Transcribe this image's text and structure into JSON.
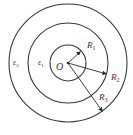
{
  "diagram": {
    "center": {
      "label": "O",
      "x": 68,
      "y": 63
    },
    "circles": [
      {
        "name": "inner",
        "radius": 18
      },
      {
        "name": "middle",
        "radius": 40
      },
      {
        "name": "outer",
        "radius": 59
      }
    ],
    "radii": [
      {
        "label": "R",
        "sub": "1",
        "tip": [
          81,
          51
        ],
        "label_pos": [
          87,
          48
        ]
      },
      {
        "label": "R",
        "sub": "2",
        "tip": [
          107,
          74
        ],
        "label_pos": [
          111,
          80
        ]
      },
      {
        "label": "R",
        "sub": "3",
        "tip": [
          103,
          112
        ],
        "label_pos": [
          99,
          100
        ]
      }
    ],
    "regions": [
      {
        "label": "ε",
        "sub": "1",
        "pos": [
          38,
          65
        ]
      },
      {
        "label": "ε",
        "sub": "2",
        "pos": [
          13,
          65
        ]
      }
    ],
    "colors": {
      "stroke": "#3a3a3a",
      "text": "#333333",
      "background": "#ffffff"
    }
  }
}
